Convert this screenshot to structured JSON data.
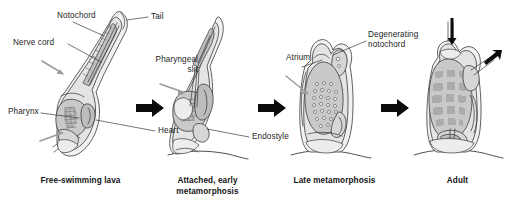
{
  "figure": {
    "background_color": "#ffffff",
    "ink_color": "#2b2b2b",
    "arrow_color": "#0b0b0b",
    "pointer_color": "#9a9a9a"
  },
  "stages": [
    {
      "id": "stage-1",
      "caption": "Free-swimming lava",
      "labels": [
        {
          "name": "notochord",
          "text": "Notochord"
        },
        {
          "name": "nerve-cord",
          "text": "Nerve cord"
        },
        {
          "name": "tail",
          "text": "Tail"
        },
        {
          "name": "pharynx",
          "text": "Pharynx"
        },
        {
          "name": "heart",
          "text": "Heart"
        }
      ]
    },
    {
      "id": "stage-2",
      "caption": "Attached, early\nmetamorphosis",
      "labels": [
        {
          "name": "pharyngeal-slit",
          "text": "Pharyngeal\nslit"
        },
        {
          "name": "endostyle",
          "text": "Endostyle"
        }
      ]
    },
    {
      "id": "stage-3",
      "caption": "Late metamorphosis",
      "labels": [
        {
          "name": "atrium",
          "text": "Atrium"
        },
        {
          "name": "degenerating-notochord",
          "text": "Degenerating\nnotochord"
        }
      ]
    },
    {
      "id": "stage-4",
      "caption": "Adult",
      "labels": []
    }
  ],
  "transitions": [
    {
      "name": "arrow-stage1-to-stage2",
      "glyph": "arrow-right"
    },
    {
      "name": "arrow-stage2-to-stage3",
      "glyph": "arrow-right"
    },
    {
      "name": "arrow-stage3-to-stage4",
      "glyph": "arrow-right"
    }
  ]
}
